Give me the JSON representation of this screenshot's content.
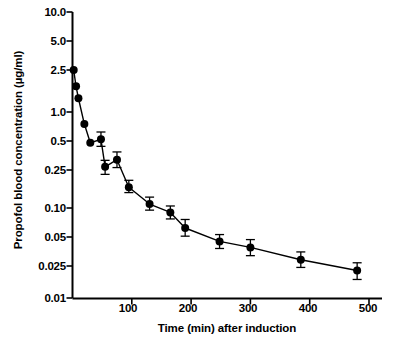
{
  "chart_data": {
    "type": "line",
    "title": "",
    "xlabel": "Time (min) after induction",
    "ylabel": "Propofol blood concentration (µg/ml)",
    "yscale": "log",
    "xscale": "linear",
    "xlim": [
      0,
      520
    ],
    "ylim": [
      0.01,
      10.0
    ],
    "grid": false,
    "legend": null,
    "xticks": [
      100,
      200,
      300,
      400,
      500
    ],
    "xtick_labels": [
      "100",
      "200",
      "300",
      "400",
      "500"
    ],
    "yticks": [
      10.0,
      5.0,
      2.5,
      1.0,
      0.5,
      0.25,
      0.1,
      0.05,
      0.025,
      0.01
    ],
    "ytick_labels": [
      "10.0",
      "5.0",
      "2.5",
      "1.0",
      "0.5",
      "0.25",
      "0.10",
      "0.05",
      "0.025",
      "0.01"
    ],
    "marker": "filled-circle",
    "errorbars": true,
    "series": [
      {
        "name": "Propofol blood concentration",
        "x": [
          2,
          6,
          10,
          20,
          30,
          48,
          55,
          75,
          95,
          130,
          165,
          190,
          248,
          300,
          385,
          480
        ],
        "y": [
          2.5,
          1.75,
          1.35,
          0.75,
          0.48,
          0.52,
          0.27,
          0.32,
          0.165,
          0.11,
          0.09,
          0.062,
          0.045,
          0.039,
          0.029,
          0.022
        ],
        "yerr_low": [
          2.5,
          1.75,
          1.35,
          0.75,
          0.48,
          0.44,
          0.225,
          0.265,
          0.145,
          0.095,
          0.077,
          0.051,
          0.038,
          0.032,
          0.024,
          0.017
        ],
        "yerr_high": [
          2.5,
          1.75,
          1.35,
          0.75,
          0.48,
          0.62,
          0.315,
          0.385,
          0.195,
          0.13,
          0.105,
          0.076,
          0.053,
          0.047,
          0.035,
          0.027
        ]
      }
    ]
  },
  "colors": {
    "axis": "#000000",
    "marker": "#000000",
    "line": "#000000",
    "background": "#ffffff"
  }
}
